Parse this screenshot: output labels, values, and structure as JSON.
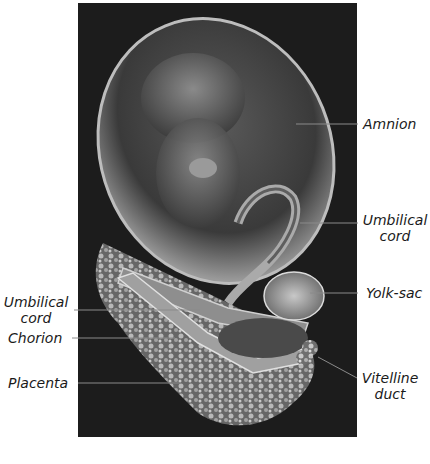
{
  "figure": {
    "colors": {
      "background": "#ffffff",
      "panel": "#1c1c1c",
      "text": "#1a1a1a",
      "leader": "#8a8a8a"
    }
  },
  "labels": {
    "right": [
      {
        "id": "amnion",
        "text": "Amnion"
      },
      {
        "id": "umbilical_cord_right",
        "line1": "Umbilical",
        "line2": "cord"
      },
      {
        "id": "yolk_sac",
        "text": "Yolk-sac"
      },
      {
        "id": "vitelline_duct",
        "line1": "Vitelline",
        "line2": "duct"
      }
    ],
    "left": [
      {
        "id": "umbilical_cord_left",
        "line1": "Umbilical",
        "line2": "cord"
      },
      {
        "id": "chorion",
        "text": "Chorion"
      },
      {
        "id": "placenta",
        "text": "Placenta"
      }
    ]
  }
}
